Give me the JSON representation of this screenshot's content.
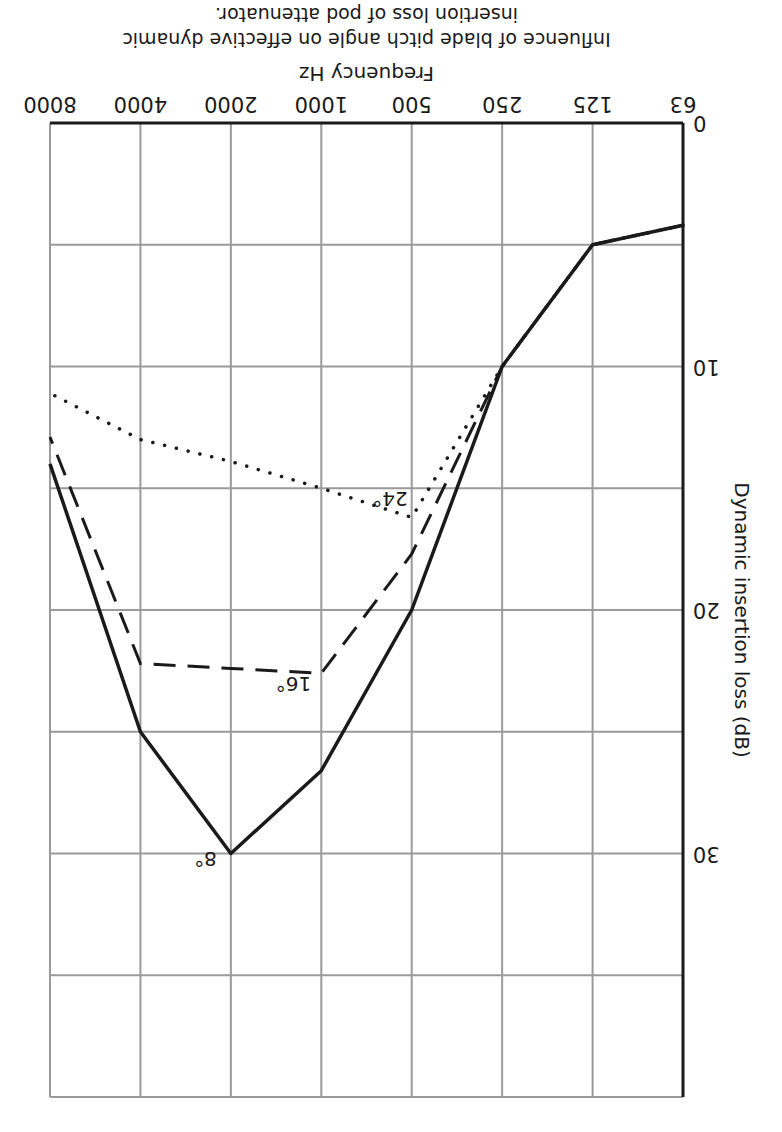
{
  "chart_data": {
    "type": "line",
    "title": "Influence of blade pitch angle on effective dynamic insertion loss of pod attenuator.",
    "title_lines": [
      "Influence of blade pitch angle on effective dynamic",
      "insertion loss of pod attenuator."
    ],
    "xlabel": "Frequency Hz",
    "ylabel": "Dynamic insertion loss (dB)",
    "categories": [
      "63",
      "125",
      "250",
      "500",
      "1000",
      "2000",
      "4000",
      "8000"
    ],
    "yticks": [
      0,
      10,
      20,
      30
    ],
    "ylim": [
      0,
      40
    ],
    "grid": true,
    "orientation_note": "figure rendered rotated 180 degrees",
    "series": [
      {
        "name": "8°",
        "style": "solid",
        "values": [
          4.2,
          5.0,
          10.0,
          20.0,
          26.6,
          30.0,
          25.0,
          14.0
        ]
      },
      {
        "name": "16°",
        "style": "dashed",
        "values": [
          4.2,
          5.0,
          10.0,
          17.7,
          22.6,
          22.4,
          22.2,
          12.9
        ]
      },
      {
        "name": "24°",
        "style": "dotted",
        "values": [
          4.2,
          5.0,
          10.0,
          16.2,
          15.0,
          13.9,
          13.0,
          11.1
        ]
      }
    ],
    "annotations": [
      {
        "text": "8°",
        "series": "8°"
      },
      {
        "text": "16°",
        "series": "16°"
      },
      {
        "text": "24°",
        "series": "24°"
      }
    ]
  }
}
